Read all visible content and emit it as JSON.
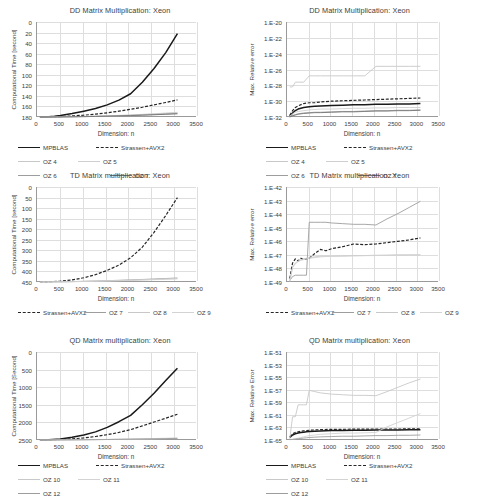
{
  "figure": {
    "axis_labels": {
      "x": "Dimension: n",
      "y_time_dd": "Computational Time [second]",
      "y_time_td": "Computational Time [second]",
      "y_time_qd": "Computational Time [Second]",
      "y_err_dd": "Max. Relative error",
      "y_err_td": "Max. Relative error",
      "y_err_qd": "Max. Relative Error"
    },
    "colors": {
      "mpblas": "#1a1a1a",
      "strassen": "#262626",
      "oz_light": "#c8c8c8",
      "oz_mid": "#9d9d9d",
      "oz_dark": "#777777",
      "grid": "#dedede",
      "axis": "#9a9a9a",
      "text": "#404040"
    }
  },
  "chart_data": [
    {
      "id": "dd-time",
      "type": "line",
      "title": "DD Matrix Multiplication: Xeon",
      "xlabel": "Dimension: n",
      "ylabel": "Computational Time [second]",
      "xlim": [
        0,
        3500
      ],
      "ylim": [
        0,
        180
      ],
      "xticks": [
        "0",
        "500",
        "1000",
        "1500",
        "2000",
        "2500",
        "3000",
        "3500"
      ],
      "yticks": [
        "0",
        "20",
        "40",
        "60",
        "80",
        "100",
        "120",
        "140",
        "160",
        "180"
      ],
      "grid": true,
      "legend_position": "bottom",
      "x": [
        64,
        128,
        256,
        384,
        512,
        768,
        1024,
        1280,
        1536,
        1792,
        2048,
        2304,
        2560,
        2816,
        3072
      ],
      "series": [
        {
          "name": "MPBLAS",
          "style": "solid-thick",
          "color": "#1a1a1a",
          "values": [
            0.02,
            0.1,
            0.6,
            1.6,
            3.0,
            6.5,
            11.0,
            16.0,
            23.0,
            32.0,
            44.0,
            66.0,
            92.0,
            122.0,
            158.0
          ]
        },
        {
          "name": "Strassen+AVX2",
          "style": "dashed",
          "color": "#262626",
          "values": [
            0.01,
            0.03,
            0.15,
            0.4,
            0.8,
            2.0,
            3.4,
            5.4,
            8.0,
            11.0,
            14.5,
            18.5,
            23.0,
            27.5,
            32.5
          ]
        },
        {
          "name": "OZ 4",
          "style": "solid-light",
          "color": "#c8c8c8",
          "values": [
            0.005,
            0.01,
            0.05,
            0.12,
            0.25,
            0.6,
            1.0,
            1.5,
            2.2,
            3.0,
            3.9,
            5.0,
            6.1,
            7.4,
            8.8
          ]
        },
        {
          "name": "OZ 5",
          "style": "solid-light",
          "color": "#cfcfcf",
          "values": [
            0.004,
            0.01,
            0.04,
            0.1,
            0.21,
            0.5,
            0.85,
            1.3,
            1.9,
            2.6,
            3.4,
            4.3,
            5.3,
            6.4,
            7.6
          ]
        },
        {
          "name": "OZ 6",
          "style": "solid-mid",
          "color": "#9d9d9d",
          "values": [
            0.004,
            0.008,
            0.035,
            0.09,
            0.18,
            0.45,
            0.75,
            1.15,
            1.7,
            2.3,
            3.0,
            3.8,
            4.7,
            5.7,
            6.7
          ]
        },
        {
          "name": "OZ 7",
          "style": "solid-dark",
          "color": "#777777",
          "values": [
            0.003,
            0.007,
            0.03,
            0.08,
            0.16,
            0.4,
            0.68,
            1.05,
            1.5,
            2.1,
            2.7,
            3.4,
            4.2,
            5.1,
            6.0
          ]
        }
      ]
    },
    {
      "id": "dd-error",
      "type": "line",
      "title": "DD Matrix Multiplication: Xeon",
      "xlabel": "Dimension: n",
      "ylabel": "Max. Relative error",
      "xlim": [
        0,
        3500
      ],
      "ylim_log_exp": [
        -32,
        -20
      ],
      "xticks": [
        "0",
        "500",
        "1000",
        "1500",
        "2000",
        "2500",
        "3000",
        "3500"
      ],
      "yticks": [
        "1.E-20",
        "1.E-22",
        "1.E-24",
        "1.E-26",
        "1.E-28",
        "1.E-30",
        "1.E-32"
      ],
      "grid": true,
      "legend_position": "bottom",
      "x": [
        64,
        128,
        192,
        256,
        384,
        512,
        640,
        768,
        1024,
        1280,
        1536,
        1792,
        2048,
        2304,
        2560,
        2816,
        3072
      ],
      "series": [
        {
          "name": "MPBLAS",
          "style": "solid-thick",
          "color": "#1a1a1a",
          "exponents": [
            -31.9,
            -31.5,
            -31.2,
            -31.0,
            -30.8,
            -30.7,
            -30.65,
            -30.6,
            -30.55,
            -30.5,
            -30.45,
            -30.45,
            -30.4,
            -30.4,
            -30.35,
            -30.35,
            -30.3
          ]
        },
        {
          "name": "Strassen+AVX2",
          "style": "dashed",
          "color": "#262626",
          "exponents": [
            -31.8,
            -31.2,
            -30.8,
            -30.6,
            -30.3,
            -30.2,
            -30.2,
            -30.1,
            -30.0,
            -29.95,
            -29.9,
            -29.85,
            -29.8,
            -29.75,
            -29.7,
            -29.65,
            -29.6
          ]
        },
        {
          "name": "OZ 4",
          "style": "solid-light",
          "color": "#c8c8c8",
          "exponents": [
            -28.2,
            -28.2,
            -27.6,
            -27.6,
            -27.6,
            -26.8,
            -26.8,
            -26.8,
            -26.8,
            -26.8,
            -26.8,
            -26.8,
            -25.6,
            -25.6,
            -25.6,
            -25.6,
            -25.6
          ]
        },
        {
          "name": "OZ 5",
          "style": "solid-light",
          "color": "#cfcfcf",
          "exponents": [
            -31.9,
            -31.6,
            -31.4,
            -31.3,
            -31.2,
            -31.1,
            -31.05,
            -31.0,
            -31.0,
            -30.95,
            -30.9,
            -30.9,
            -30.85,
            -30.85,
            -30.8,
            -30.8,
            -30.8
          ]
        },
        {
          "name": "OZ 6",
          "style": "solid-mid",
          "color": "#9d9d9d",
          "exponents": [
            -32.0,
            -31.8,
            -31.7,
            -31.6,
            -31.5,
            -31.45,
            -31.4,
            -31.4,
            -31.35,
            -31.3,
            -31.3,
            -31.25,
            -31.2,
            -31.2,
            -31.15,
            -31.15,
            -31.1
          ]
        },
        {
          "name": "OZ 7",
          "style": "solid-dark",
          "color": "#777777",
          "exponents": [
            -32.0,
            -31.85,
            -31.75,
            -31.65,
            -31.55,
            -31.5,
            -31.45,
            -31.45,
            -31.4,
            -31.35,
            -31.35,
            -31.3,
            -31.25,
            -31.25,
            -31.2,
            -31.2,
            -31.15
          ]
        }
      ]
    },
    {
      "id": "td-time",
      "type": "line",
      "title": "TD Matrix multiplication: Xeon",
      "xlabel": "Dimension: n",
      "ylabel": "Computational Time [second]",
      "xlim": [
        0,
        3500
      ],
      "ylim": [
        0,
        450
      ],
      "xticks": [
        "0",
        "500",
        "1000",
        "1500",
        "2000",
        "2500",
        "3000",
        "3500"
      ],
      "yticks": [
        "0",
        "50",
        "100",
        "150",
        "200",
        "250",
        "300",
        "350",
        "400",
        "450"
      ],
      "grid": true,
      "legend_position": "bottom",
      "x": [
        64,
        256,
        512,
        768,
        1024,
        1280,
        1536,
        1792,
        2048,
        2304,
        2560,
        2816,
        3072
      ],
      "series": [
        {
          "name": "Strassen+AVX2",
          "style": "dashed",
          "color": "#262626",
          "values": [
            0.2,
            1.0,
            4.0,
            10.0,
            20.0,
            35.0,
            55.0,
            80.0,
            115.0,
            165.0,
            235.0,
            315.0,
            400.0
          ]
        },
        {
          "name": "OZ 7",
          "style": "solid-mid",
          "color": "#9d9d9d",
          "values": [
            0.05,
            0.3,
            1.0,
            2.0,
            3.2,
            4.6,
            6.2,
            8.0,
            10.0,
            12.0,
            14.2,
            16.5,
            19.0
          ]
        },
        {
          "name": "OZ 8",
          "style": "solid-light",
          "color": "#c8c8c8",
          "values": [
            0.04,
            0.25,
            0.85,
            1.7,
            2.8,
            4.0,
            5.4,
            7.0,
            8.7,
            10.5,
            12.4,
            14.5,
            16.6
          ]
        },
        {
          "name": "OZ 9",
          "style": "solid-light",
          "color": "#d3d3d3",
          "values": [
            0.04,
            0.22,
            0.75,
            1.5,
            2.5,
            3.6,
            4.8,
            6.2,
            7.7,
            9.3,
            11.0,
            12.8,
            14.7
          ]
        }
      ]
    },
    {
      "id": "td-error",
      "type": "line",
      "title": "TD Matrix multiplication: Xeon",
      "xlabel": "Dimension: n",
      "ylabel": "Max. Relative error",
      "xlim": [
        0,
        3500
      ],
      "ylim_log_exp": [
        -49,
        -42
      ],
      "xticks": [
        "0",
        "500",
        "1000",
        "1500",
        "2000",
        "2500",
        "3000",
        "3500"
      ],
      "yticks": [
        "1.E-42",
        "1.E-43",
        "1.E-44",
        "1.E-45",
        "1.E-46",
        "1.E-47",
        "1.E-48",
        "1.E-49"
      ],
      "grid": true,
      "legend_position": "bottom",
      "x": [
        64,
        128,
        192,
        256,
        320,
        384,
        448,
        512,
        640,
        768,
        896,
        1024,
        1280,
        1536,
        1792,
        2048,
        2304,
        2560,
        2816,
        3072
      ],
      "series": [
        {
          "name": "Strassen+AVX2",
          "style": "dashed",
          "color": "#262626",
          "exponents": [
            -48.75,
            -47.6,
            -47.3,
            -47.45,
            -47.25,
            -47.35,
            -47.3,
            -47.25,
            -46.9,
            -46.6,
            -46.7,
            -46.55,
            -46.4,
            -46.2,
            -46.25,
            -46.2,
            -46.1,
            -46.0,
            -45.9,
            -45.75
          ]
        },
        {
          "name": "OZ 7",
          "style": "solid-mid",
          "color": "#9d9d9d",
          "exponents": [
            -48.9,
            -48.6,
            -48.5,
            -48.5,
            -48.5,
            -48.5,
            -48.5,
            -44.6,
            -44.6,
            -44.6,
            -44.6,
            -44.65,
            -44.7,
            -44.75,
            -44.75,
            -44.8,
            -44.35,
            -43.95,
            -43.5,
            -43.05
          ]
        },
        {
          "name": "OZ 8",
          "style": "solid-light",
          "color": "#c8c8c8",
          "exponents": [
            -48.95,
            -47.9,
            -47.6,
            -47.45,
            -47.35,
            -47.3,
            -47.25,
            -47.2,
            -47.15,
            -47.1,
            -47.1,
            -47.1,
            -47.08,
            -47.05,
            -47.05,
            -47.03,
            -47.02,
            -47.0,
            -47.0,
            -47.0
          ]
        },
        {
          "name": "OZ 9",
          "style": "solid-light",
          "color": "#d3d3d3",
          "exponents": [
            -48.95,
            -47.95,
            -47.65,
            -47.5,
            -47.4,
            -47.35,
            -47.3,
            -47.25,
            -47.2,
            -47.15,
            -47.12,
            -47.1,
            -47.1,
            -47.08,
            -47.06,
            -47.05,
            -47.04,
            -47.02,
            -47.01,
            -47.0
          ]
        }
      ]
    },
    {
      "id": "qd-time",
      "type": "line",
      "title": "QD Matrix multiplication: Xeon",
      "xlabel": "Dimension: n",
      "ylabel": "Computational Time [Second]",
      "xlim": [
        0,
        3500
      ],
      "ylim": [
        0,
        2500
      ],
      "xticks": [
        "0",
        "500",
        "1000",
        "1500",
        "2000",
        "2500",
        "3000",
        "3500"
      ],
      "yticks": [
        "0",
        "500",
        "1000",
        "1500",
        "2000",
        "2500"
      ],
      "grid": true,
      "legend_position": "bottom",
      "x": [
        64,
        256,
        512,
        768,
        1024,
        1280,
        1536,
        1792,
        2048,
        2304,
        2560,
        2816,
        3072
      ],
      "series": [
        {
          "name": "MPBLAS",
          "style": "solid-thick",
          "color": "#1a1a1a",
          "values": [
            1,
            8,
            30,
            75,
            140,
            230,
            360,
            520,
            700,
            1000,
            1330,
            1690,
            2040
          ]
        },
        {
          "name": "Strassen+AVX2",
          "style": "dashed",
          "color": "#262626",
          "values": [
            0.5,
            4,
            14,
            32,
            60,
            100,
            150,
            215,
            295,
            400,
            510,
            620,
            730
          ]
        },
        {
          "name": "OZ 10",
          "style": "solid-light",
          "color": "#c8c8c8",
          "values": [
            0.1,
            0.8,
            2.5,
            5,
            8,
            12,
            17,
            22,
            28,
            34,
            41,
            48,
            56
          ]
        },
        {
          "name": "OZ 11",
          "style": "solid-light",
          "color": "#d3d3d3",
          "values": [
            0.09,
            0.7,
            2.2,
            4.4,
            7,
            10.5,
            15,
            19.5,
            25,
            30,
            36,
            42,
            49
          ]
        },
        {
          "name": "OZ 12",
          "style": "solid-mid",
          "color": "#9d9d9d",
          "values": [
            0.08,
            0.6,
            2.0,
            4.0,
            6.5,
            9.5,
            13.5,
            18,
            23,
            28,
            33,
            39,
            45
          ]
        }
      ]
    },
    {
      "id": "qd-error",
      "type": "line",
      "title": "QD Matrix multiplication: Xeon",
      "xlabel": "Dimension: n",
      "ylabel": "Max. Relative Error",
      "xlim": [
        0,
        3500
      ],
      "ylim_log_exp": [
        -65,
        -51
      ],
      "xticks": [
        "0",
        "500",
        "1000",
        "1500",
        "2000",
        "2500",
        "3000",
        "3500"
      ],
      "yticks": [
        "1.E-51",
        "1.E-53",
        "1.E-55",
        "1.E-57",
        "1.E-59",
        "1.E-61",
        "1.E-63",
        "1.E-65"
      ],
      "grid": true,
      "legend_position": "bottom",
      "x": [
        64,
        128,
        192,
        256,
        320,
        384,
        448,
        512,
        640,
        768,
        1024,
        1280,
        1536,
        1792,
        2048,
        2304,
        2560,
        2816,
        3072
      ],
      "series": [
        {
          "name": "MPBLAS",
          "style": "solid-thick",
          "color": "#1a1a1a",
          "exponents": [
            -64.6,
            -64.2,
            -64.0,
            -63.9,
            -63.8,
            -63.75,
            -63.7,
            -63.65,
            -63.6,
            -63.55,
            -63.5,
            -63.5,
            -63.45,
            -63.45,
            -63.4,
            -63.4,
            -63.4,
            -63.35,
            -63.35
          ]
        },
        {
          "name": "Strassen+AVX2",
          "style": "dashed",
          "color": "#262626",
          "exponents": [
            -64.5,
            -64.0,
            -63.8,
            -63.7,
            -63.6,
            -63.55,
            -63.5,
            -63.45,
            -63.4,
            -63.35,
            -63.3,
            -63.3,
            -63.28,
            -63.26,
            -63.25,
            -63.25,
            -63.25,
            -63.24,
            -63.22
          ]
        },
        {
          "name": "OZ 10",
          "style": "solid-light",
          "color": "#c8c8c8",
          "exponents": [
            -64.8,
            -61.3,
            -61.3,
            -59.4,
            -59.4,
            -59.4,
            -59.4,
            -57.1,
            -57.3,
            -57.5,
            -57.7,
            -57.8,
            -57.9,
            -57.9,
            -57.95,
            -57.3,
            -56.6,
            -55.9,
            -55.3
          ]
        },
        {
          "name": "OZ 11",
          "style": "solid-light",
          "color": "#d3d3d3",
          "exponents": [
            -64.9,
            -64.9,
            -64.8,
            -64.7,
            -64.6,
            -64.5,
            -64.4,
            -64.3,
            -64.2,
            -64.1,
            -64.0,
            -63.9,
            -63.9,
            -63.85,
            -63.8,
            -62.9,
            -62.2,
            -61.5,
            -60.8
          ]
        },
        {
          "name": "OZ 12",
          "style": "solid-mid",
          "color": "#9d9d9d",
          "exponents": [
            -64.95,
            -64.9,
            -64.85,
            -64.8,
            -64.75,
            -64.7,
            -64.65,
            -64.6,
            -64.55,
            -64.5,
            -64.45,
            -64.4,
            -64.4,
            -64.35,
            -64.3,
            -64.3,
            -64.25,
            -64.25,
            -64.2
          ]
        }
      ]
    }
  ]
}
